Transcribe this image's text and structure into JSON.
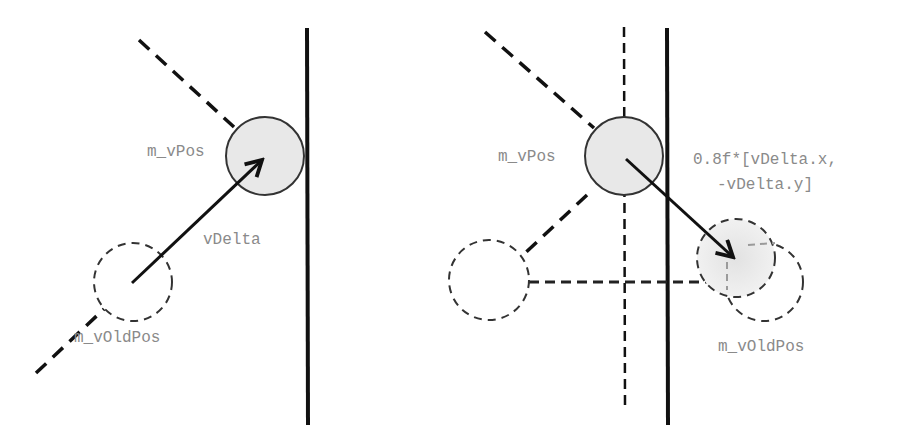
{
  "left_panel": {
    "labels": {
      "pos": "m_vPos",
      "delta": "vDelta",
      "old_pos": "m_vOldPos"
    }
  },
  "right_panel": {
    "labels": {
      "pos": "m_vPos",
      "formula_line1": "0.8f*[vDelta.x,",
      "formula_line2": "-vDelta.y]",
      "old_pos": "m_vOldPos"
    }
  },
  "colors": {
    "line": "#111111",
    "circle_fill": "#e8e8e8",
    "label": "#8a8a8a",
    "faded_dash": "#9a9a9a"
  }
}
